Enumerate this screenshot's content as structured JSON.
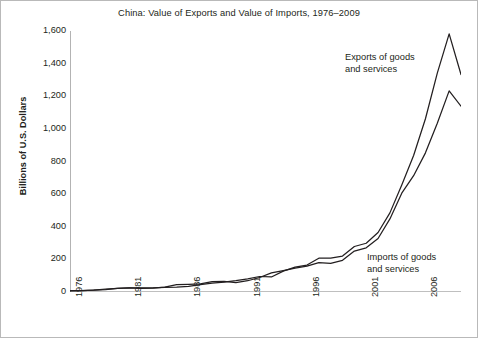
{
  "chart_title": "China: Value of Exports and Value of Imports, 1976–2009",
  "axis": {
    "ylabel": "Billions of U.S. Dollars",
    "yticks": [
      "0",
      "200",
      "400",
      "600",
      "800",
      "1,000",
      "1,200",
      "1,400",
      "1,600"
    ],
    "xticks": [
      "1976",
      "1981",
      "1986",
      "1991",
      "1996",
      "2001",
      "2006"
    ]
  },
  "annotations": {
    "exports": {
      "line1": "Exports of goods",
      "line2": "and services"
    },
    "imports": {
      "line1": "Imports of goods",
      "line2": "and services"
    }
  },
  "colors": {
    "line": "#231f20",
    "axis": "#808080",
    "frame": "#b9b9b9",
    "background": "#ffffff"
  },
  "chart_data": {
    "type": "line",
    "title": "China: Value of Exports and Value of Imports, 1976–2009",
    "xlabel": "",
    "ylabel": "Billions of U.S. Dollars",
    "xlim": [
      1976,
      2009
    ],
    "ylim": [
      0,
      1600
    ],
    "ytick_step": 200,
    "grid": false,
    "legend": "annotations-inline",
    "x": [
      1976,
      1977,
      1978,
      1979,
      1980,
      1981,
      1982,
      1983,
      1984,
      1985,
      1986,
      1987,
      1988,
      1989,
      1990,
      1991,
      1992,
      1993,
      1994,
      1995,
      1996,
      1997,
      1998,
      1999,
      2000,
      2001,
      2002,
      2003,
      2004,
      2005,
      2006,
      2007,
      2008,
      2009
    ],
    "series": [
      {
        "name": "Exports of goods and services",
        "values": [
          8,
          9,
          11,
          15,
          22,
          26,
          26,
          26,
          29,
          30,
          34,
          45,
          55,
          60,
          69,
          81,
          95,
          92,
          128,
          152,
          165,
          207,
          207,
          220,
          279,
          299,
          365,
          485,
          656,
          837,
          1062,
          1342,
          1582,
          1333
        ]
      },
      {
        "name": "Imports of goods and services",
        "values": [
          7,
          8,
          12,
          17,
          22,
          25,
          22,
          24,
          30,
          45,
          47,
          50,
          63,
          65,
          57,
          69,
          89,
          117,
          131,
          146,
          159,
          180,
          175,
          194,
          251,
          271,
          328,
          448,
          606,
          713,
          853,
          1035,
          1233,
          1139
        ]
      }
    ]
  }
}
